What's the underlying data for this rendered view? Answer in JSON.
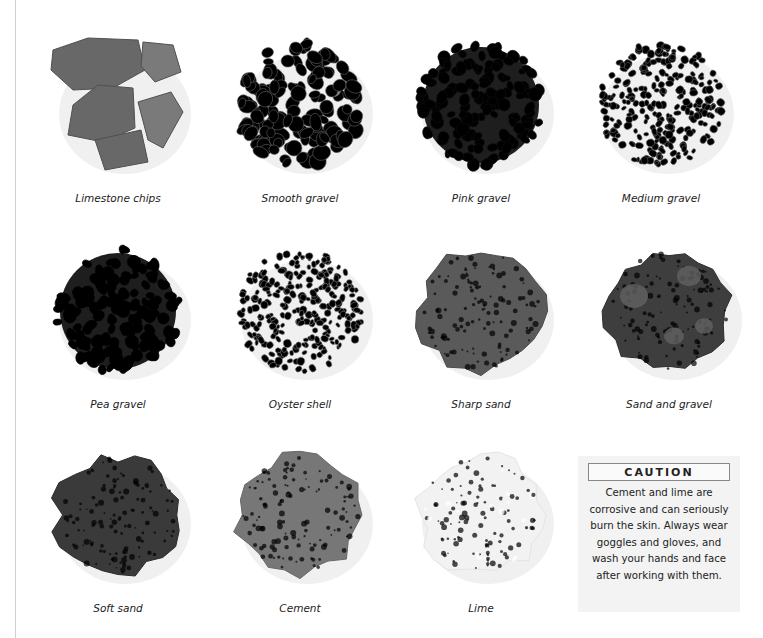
{
  "materials": [
    {
      "name": "Limestone chips",
      "style": "chips",
      "tone": "#6e6e6e"
    },
    {
      "name": "Smooth gravel",
      "style": "pebbles",
      "tone": "#8a8a8a"
    },
    {
      "name": "Pink gravel",
      "style": "pebbles-dark",
      "tone": "#3c3c3c"
    },
    {
      "name": "Medium gravel",
      "style": "fine-gravel",
      "tone": "#8c8c8c"
    },
    {
      "name": "Pea gravel",
      "style": "pebbles-dark",
      "tone": "#2e2e2e"
    },
    {
      "name": "Oyster shell",
      "style": "fine-gravel",
      "tone": "#a8a8a8"
    },
    {
      "name": "Sharp sand",
      "style": "powder",
      "tone": "#5a5a5a"
    },
    {
      "name": "Sand and gravel",
      "style": "powder-lumps",
      "tone": "#3e3e3e"
    },
    {
      "name": "Soft sand",
      "style": "powder",
      "tone": "#3a3a3a"
    },
    {
      "name": "Cement",
      "style": "powder",
      "tone": "#777777"
    },
    {
      "name": "Lime",
      "style": "powder",
      "tone": "#f2f2f2"
    }
  ],
  "caution": {
    "title": "CAUTION",
    "text": "Cement and lime are corrosive and can seriously burn the skin. Always wear goggles and gloves, and wash your hands and face after working with them."
  }
}
